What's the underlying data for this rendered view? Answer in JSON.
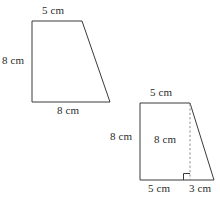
{
  "diagram": {
    "units": "cm",
    "stroke_color": "#3a3a3a",
    "dashed_color": "#8a8a8a",
    "background_color": "#ffffff",
    "shapes": [
      {
        "id": "trapezoid-left",
        "name": "left-trapezoid",
        "labels": {
          "top": "5 cm",
          "left": "8 cm",
          "bottom": "8 cm"
        }
      },
      {
        "id": "trapezoid-right",
        "name": "right-trapezoid",
        "labels": {
          "top": "5 cm",
          "left": "8 cm",
          "height": "8 cm",
          "bottom_left": "5 cm",
          "bottom_right": "3 cm"
        },
        "has_dashed_height": true,
        "has_right_angle_marker": true
      }
    ]
  }
}
